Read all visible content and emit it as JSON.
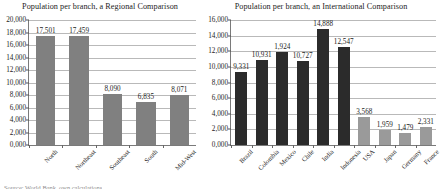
{
  "footnote": "Source: World Bank, own calculations",
  "charts": [
    {
      "title": "Population per branch, a Regional Comparison",
      "bar_color": "#808080",
      "ylabel": "",
      "xlabel": "",
      "ylim": [
        0,
        20000
      ],
      "ystep": 2000,
      "ytick_labels": [
        "0,000",
        "2,000",
        "4,000",
        "6,000",
        "8,000",
        "10,000",
        "12,000",
        "14,000",
        "16,000",
        "18,000",
        "20,000"
      ],
      "categories": [
        "North",
        "Northeast",
        "Southeast",
        "South",
        "Mid-West"
      ],
      "values": [
        17501,
        17459,
        8090,
        6835,
        8071
      ],
      "value_labels": [
        "17,501",
        "17,459",
        "8,090",
        "6,835",
        "8,071"
      ]
    },
    {
      "title": "Population per branch, an International Comparison",
      "bar_color": "#2b2b2b",
      "bar_color_alt": "#9a9a9a",
      "alt_start_index": 6,
      "ylabel": "",
      "xlabel": "",
      "ylim": [
        0,
        16000
      ],
      "ystep": 2000,
      "ytick_labels": [
        "0,000",
        "2,000",
        "4,000",
        "6,000",
        "8,000",
        "10,000",
        "12,000",
        "14,000",
        "16,000"
      ],
      "categories": [
        "Brazil",
        "Colombia",
        "Mexico",
        "Chile",
        "India",
        "Indonesia",
        "USA",
        "Japan",
        "Germany",
        "France"
      ],
      "values": [
        9331,
        10931,
        11924,
        10727,
        14888,
        12547,
        3568,
        1959,
        1479,
        2331
      ],
      "value_labels": [
        "9,331",
        "10,931",
        "1,924",
        "10,727",
        "14,888",
        "12,547",
        "3,568",
        "1,959",
        "1,479",
        "2,331"
      ]
    }
  ],
  "chart_data": [
    {
      "type": "bar",
      "title": "Population per branch, a Regional Comparison",
      "categories": [
        "North",
        "Northeast",
        "Southeast",
        "South",
        "Mid-West"
      ],
      "values": [
        17501,
        17459,
        8090,
        6835,
        8071
      ],
      "xlabel": "",
      "ylabel": "",
      "ylim": [
        0,
        20000
      ],
      "ytick_step": 2000,
      "grid": true,
      "legend": "none",
      "series_color": "#808080"
    },
    {
      "type": "bar",
      "title": "Population per branch, an International Comparison",
      "categories": [
        "Brazil",
        "Colombia",
        "Mexico",
        "Chile",
        "India",
        "Indonesia",
        "USA",
        "Japan",
        "Germany",
        "France"
      ],
      "values": [
        9331,
        10931,
        11924,
        10727,
        14888,
        12547,
        3568,
        1959,
        1479,
        2331
      ],
      "xlabel": "",
      "ylabel": "",
      "ylim": [
        0,
        16000
      ],
      "ytick_step": 2000,
      "grid": true,
      "legend": "none",
      "series_colors": [
        "#2b2b2b",
        "#2b2b2b",
        "#2b2b2b",
        "#2b2b2b",
        "#2b2b2b",
        "#2b2b2b",
        "#9a9a9a",
        "#9a9a9a",
        "#9a9a9a",
        "#9a9a9a"
      ]
    }
  ]
}
